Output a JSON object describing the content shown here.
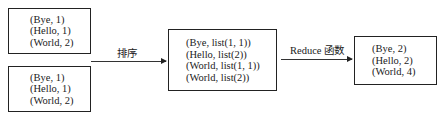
{
  "inputs": [
    {
      "lines": [
        "(Bye, 1)",
        "(Hello, 1)",
        "(World, 2)"
      ]
    },
    {
      "lines": [
        "(Bye, 1)",
        "(Hello, 1)",
        "(World, 2)"
      ]
    }
  ],
  "sort_label": "排序",
  "grouped": {
    "lines": [
      "(Bye, list(1, 1))",
      "(Hello, list(2))",
      "(World, list(1, 1))",
      "(World, list(2))"
    ]
  },
  "reduce_label": "Reduce 函数",
  "output": {
    "lines": [
      "(Bye, 2)",
      "(Hello, 2)",
      "(World, 4)"
    ]
  }
}
